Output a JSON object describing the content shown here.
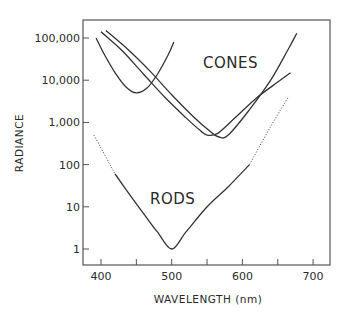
{
  "chart_data": {
    "type": "line",
    "title": "",
    "xlabel": "WAVELENGTH (nm)",
    "ylabel": "RADIANCE",
    "xlim": [
      380,
      730
    ],
    "ylim": [
      0.4,
      250000
    ],
    "yscale": "log",
    "grid": false,
    "legend": "none (inline labels)",
    "x_ticks": [
      400,
      450,
      500,
      550,
      600,
      650,
      700
    ],
    "x_tick_labels": [
      "400",
      "",
      "500",
      "",
      "600",
      "",
      "700"
    ],
    "y_ticks": [
      1,
      10,
      100,
      1000,
      10000,
      100000
    ],
    "y_tick_labels": [
      "1",
      "10",
      "100",
      "1,000",
      "10,000",
      "100,000"
    ],
    "annotations": [
      {
        "text": "CONES",
        "x": 580,
        "y": 15000
      },
      {
        "text": "RODS",
        "x": 530,
        "y": 20
      }
    ],
    "series": [
      {
        "name": "Cone (short wavelength)",
        "group": "CONES",
        "style": "solid",
        "x": [
          393,
          405,
          420,
          435,
          450,
          465,
          480,
          495,
          503
        ],
        "y": [
          100000,
          40000,
          15000,
          7000,
          5000,
          6500,
          14000,
          40000,
          80000
        ]
      },
      {
        "name": "Cone (middle wavelength)",
        "group": "CONES",
        "style": "solid",
        "x": [
          400,
          430,
          460,
          490,
          520,
          540,
          550,
          565,
          590,
          620,
          650,
          668
        ],
        "y": [
          140000,
          50000,
          14000,
          4000,
          1300,
          650,
          500,
          550,
          1300,
          3800,
          9000,
          15000
        ]
      },
      {
        "name": "Cone (long wavelength)",
        "group": "CONES",
        "style": "solid",
        "x": [
          407,
          440,
          470,
          500,
          530,
          555,
          567,
          580,
          610,
          640,
          665,
          677
        ],
        "y": [
          150000,
          50000,
          16000,
          4500,
          1400,
          600,
          450,
          500,
          2000,
          10000,
          55000,
          130000
        ]
      },
      {
        "name": "Rods",
        "group": "RODS",
        "style": "solid (dotted extrapolation at ends)",
        "x": [
          390,
          420,
          440,
          460,
          480,
          500,
          520,
          550,
          580,
          610,
          640,
          665
        ],
        "y": [
          500,
          60,
          20,
          7,
          2.5,
          1,
          2.5,
          10,
          30,
          100,
          800,
          4000
        ],
        "dotted_x_ranges": [
          [
            390,
            420
          ],
          [
            610,
            665
          ]
        ]
      }
    ]
  }
}
